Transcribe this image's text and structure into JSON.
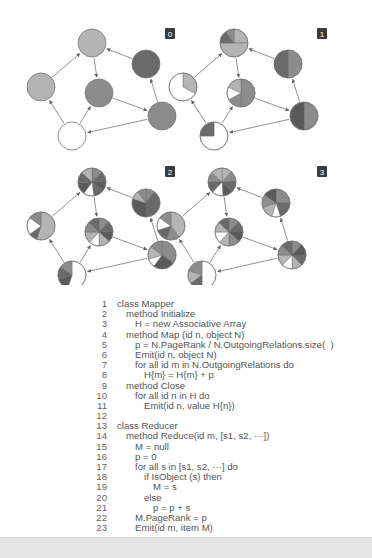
{
  "figure": {
    "panels": [
      {
        "label": "0"
      },
      {
        "label": "1"
      },
      {
        "label": "2"
      },
      {
        "label": "3"
      }
    ],
    "colors": {
      "white": "#ffffff",
      "light": "#b4b4b4",
      "medium": "#8c8c8c",
      "dark": "#6a6a6a",
      "darker": "#5a5a5a",
      "edge": "#888888",
      "badge_bg": "#3a3a3a",
      "badge_fg": "#ffffff"
    }
  },
  "code": {
    "lines": [
      {
        "n": "1",
        "indent": 0,
        "text": "class Mapper"
      },
      {
        "n": "2",
        "indent": 1,
        "text": "method Initialize"
      },
      {
        "n": "3",
        "indent": 2,
        "text": "H = new Associative Array"
      },
      {
        "n": "4",
        "indent": 1,
        "text": "method Map (id n, object N)"
      },
      {
        "n": "5",
        "indent": 2,
        "text": "p = N.PageRank / N.OutgoingRelations.size(  )"
      },
      {
        "n": "6",
        "indent": 2,
        "text": "Emit(id n, object N)"
      },
      {
        "n": "7",
        "indent": 2,
        "text": "for all id m in N.OutgoingRelations do"
      },
      {
        "n": "8",
        "indent": 3,
        "text": "H{m} = H{m} + p"
      },
      {
        "n": "9",
        "indent": 1,
        "text": "method Close"
      },
      {
        "n": "10",
        "indent": 2,
        "text": "for all id n in H do"
      },
      {
        "n": "11",
        "indent": 3,
        "text": "Emit(id n, value H{n})"
      },
      {
        "n": "12",
        "indent": 0,
        "text": ""
      },
      {
        "n": "13",
        "indent": 0,
        "text": "class Reducer"
      },
      {
        "n": "14",
        "indent": 1,
        "text": "method Reduce(id m, [s1, s2, ···])"
      },
      {
        "n": "15",
        "indent": 2,
        "text": "M = null"
      },
      {
        "n": "16",
        "indent": 2,
        "text": "p = 0"
      },
      {
        "n": "17",
        "indent": 2,
        "text": "for all s in [s1, s2, ···] do"
      },
      {
        "n": "18",
        "indent": 3,
        "text": "if IsObject (s) then"
      },
      {
        "n": "19",
        "indent": 4,
        "text": "M = s"
      },
      {
        "n": "20",
        "indent": 3,
        "text": "else"
      },
      {
        "n": "21",
        "indent": 4,
        "text": "p = p + s"
      },
      {
        "n": "22",
        "indent": 2,
        "text": "M.PageRank = p"
      },
      {
        "n": "23",
        "indent": 2,
        "text": "Emit(id m, item M)"
      }
    ]
  }
}
